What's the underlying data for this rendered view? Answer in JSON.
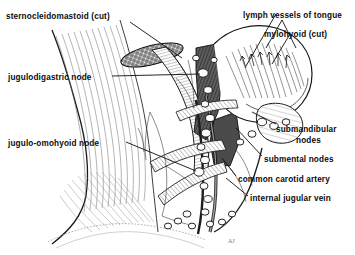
{
  "figure": {
    "type": "anatomical-line-drawing",
    "background_color": "#ffffff",
    "ink_color": "#111111",
    "artist_mark": "AJ"
  },
  "labels": [
    {
      "id": "sternocleidomastoid",
      "text": "sternocleidomastoid (cut)",
      "align": "left",
      "x": 6,
      "y": 12
    },
    {
      "id": "lymph-vessels-of-tongue",
      "text": "lymph vessels of tongue",
      "align": "left",
      "x": 243,
      "y": 11
    },
    {
      "id": "mylohyoid",
      "text": "mylohyoid (cut)",
      "align": "left",
      "x": 264,
      "y": 30
    },
    {
      "id": "jugulodigastric-node",
      "text": "jugulodigastric node",
      "align": "left",
      "x": 8,
      "y": 73
    },
    {
      "id": "jugulo-omohyoid-node",
      "text": "jugulo-omohyoid node",
      "align": "left",
      "x": 8,
      "y": 139
    },
    {
      "id": "submandibular-nodes",
      "text": "submandibular",
      "align": "left",
      "x": 276,
      "y": 125
    },
    {
      "id": "submandibular-nodes-line2",
      "text": "nodes",
      "align": "left",
      "x": 296,
      "y": 136
    },
    {
      "id": "submental-nodes",
      "text": "submental nodes",
      "align": "left",
      "x": 264,
      "y": 155
    },
    {
      "id": "common-carotid-artery",
      "text": "common carotid artery",
      "align": "left",
      "x": 238,
      "y": 175
    },
    {
      "id": "internal-jugular-vein",
      "text": "internal jugular vein",
      "align": "left",
      "x": 250,
      "y": 194
    }
  ],
  "structures": [
    "sternocleidomastoid (cut)",
    "mylohyoid (cut)",
    "lymph vessels of tongue",
    "jugulodigastric node",
    "jugulo-omohyoid node",
    "submandibular nodes",
    "submental nodes",
    "common carotid artery",
    "internal jugular vein",
    "mandible",
    "clavicle",
    "trapezius",
    "deep cervical lymph node chain"
  ]
}
